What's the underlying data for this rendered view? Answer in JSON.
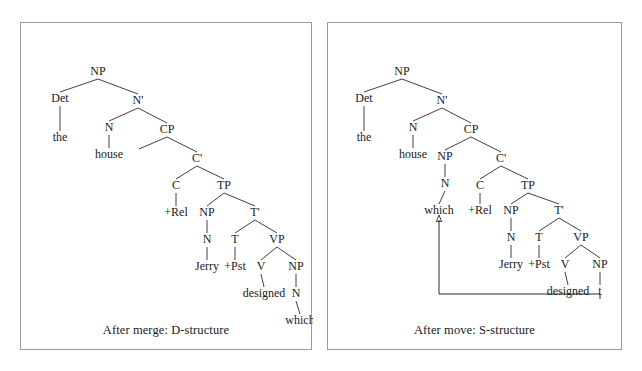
{
  "figure": {
    "background_color": "#ffffff",
    "border_color": "#9a9a9a",
    "text_color": "#1a1a1a",
    "line_color": "#2b2b2b"
  },
  "panels": [
    {
      "id": "left",
      "caption": "After merge: D-structure",
      "nodes": [
        {
          "id": "l-np",
          "label": "NP",
          "x": 77,
          "y": 52
        },
        {
          "id": "l-det",
          "label": "Det",
          "x": 39,
          "y": 79
        },
        {
          "id": "l-nbar",
          "label": "N'",
          "x": 117,
          "y": 81
        },
        {
          "id": "l-the",
          "label": "the",
          "x": 39,
          "y": 118
        },
        {
          "id": "l-n",
          "label": "N",
          "x": 88,
          "y": 108
        },
        {
          "id": "l-cp",
          "label": "CP",
          "x": 146,
          "y": 110
        },
        {
          "id": "l-house",
          "label": "house",
          "x": 88,
          "y": 135
        },
        {
          "id": "l-specempty",
          "label": "",
          "x": 118,
          "y": 136
        },
        {
          "id": "l-cbar",
          "label": "C'",
          "x": 176,
          "y": 139
        },
        {
          "id": "l-c",
          "label": "C",
          "x": 155,
          "y": 166
        },
        {
          "id": "l-tp",
          "label": "TP",
          "x": 203,
          "y": 166
        },
        {
          "id": "l-rel",
          "label": "+Rel",
          "x": 155,
          "y": 193
        },
        {
          "id": "l-np2",
          "label": "NP",
          "x": 186,
          "y": 193
        },
        {
          "id": "l-tbar",
          "label": "T'",
          "x": 234,
          "y": 193
        },
        {
          "id": "l-n2",
          "label": "N",
          "x": 186,
          "y": 220
        },
        {
          "id": "l-t",
          "label": "T",
          "x": 214,
          "y": 220
        },
        {
          "id": "l-vp",
          "label": "VP",
          "x": 256,
          "y": 220
        },
        {
          "id": "l-jerry",
          "label": "Jerry",
          "x": 186,
          "y": 247
        },
        {
          "id": "l-pst",
          "label": "+Pst",
          "x": 214,
          "y": 247
        },
        {
          "id": "l-v",
          "label": "V",
          "x": 240,
          "y": 247
        },
        {
          "id": "l-np3",
          "label": "NP",
          "x": 275,
          "y": 247
        },
        {
          "id": "l-designed",
          "label": "designed",
          "x": 243,
          "y": 274
        },
        {
          "id": "l-n3",
          "label": "N",
          "x": 275,
          "y": 274
        },
        {
          "id": "l-which",
          "label": "which",
          "x": 279,
          "y": 301
        }
      ],
      "edges": [
        [
          "l-np",
          "l-det"
        ],
        [
          "l-np",
          "l-nbar"
        ],
        [
          "l-det",
          "l-the"
        ],
        [
          "l-nbar",
          "l-n"
        ],
        [
          "l-nbar",
          "l-cp"
        ],
        [
          "l-n",
          "l-house"
        ],
        [
          "l-cp",
          "l-specempty"
        ],
        [
          "l-cp",
          "l-cbar"
        ],
        [
          "l-cbar",
          "l-c"
        ],
        [
          "l-cbar",
          "l-tp"
        ],
        [
          "l-c",
          "l-rel"
        ],
        [
          "l-tp",
          "l-np2"
        ],
        [
          "l-tp",
          "l-tbar"
        ],
        [
          "l-np2",
          "l-n2"
        ],
        [
          "l-tbar",
          "l-t"
        ],
        [
          "l-tbar",
          "l-vp"
        ],
        [
          "l-n2",
          "l-jerry"
        ],
        [
          "l-t",
          "l-pst"
        ],
        [
          "l-vp",
          "l-v"
        ],
        [
          "l-vp",
          "l-np3"
        ],
        [
          "l-v",
          "l-designed"
        ],
        [
          "l-np3",
          "l-n3"
        ],
        [
          "l-n3",
          "l-which"
        ]
      ],
      "movement": null
    },
    {
      "id": "right",
      "caption": "After move: S-structure",
      "nodes": [
        {
          "id": "r-np",
          "label": "NP",
          "x": 74,
          "y": 52
        },
        {
          "id": "r-det",
          "label": "Det",
          "x": 36,
          "y": 79
        },
        {
          "id": "r-nbar",
          "label": "N'",
          "x": 114,
          "y": 81
        },
        {
          "id": "r-the",
          "label": "the",
          "x": 36,
          "y": 118
        },
        {
          "id": "r-n",
          "label": "N",
          "x": 85,
          "y": 108
        },
        {
          "id": "r-cp",
          "label": "CP",
          "x": 143,
          "y": 110
        },
        {
          "id": "r-house",
          "label": "house",
          "x": 85,
          "y": 135
        },
        {
          "id": "r-npspec",
          "label": "NP",
          "x": 117,
          "y": 137
        },
        {
          "id": "r-cbar",
          "label": "C'",
          "x": 173,
          "y": 139
        },
        {
          "id": "r-nspec",
          "label": "N",
          "x": 117,
          "y": 164
        },
        {
          "id": "r-c",
          "label": "C",
          "x": 152,
          "y": 166
        },
        {
          "id": "r-tp",
          "label": "TP",
          "x": 200,
          "y": 166
        },
        {
          "id": "r-which",
          "label": "which",
          "x": 111,
          "y": 191
        },
        {
          "id": "r-rel",
          "label": "+Rel",
          "x": 152,
          "y": 191
        },
        {
          "id": "r-np2",
          "label": "NP",
          "x": 183,
          "y": 191
        },
        {
          "id": "r-tbar",
          "label": "T'",
          "x": 231,
          "y": 191
        },
        {
          "id": "r-n2",
          "label": "N",
          "x": 183,
          "y": 218
        },
        {
          "id": "r-t",
          "label": "T",
          "x": 211,
          "y": 218
        },
        {
          "id": "r-vp",
          "label": "VP",
          "x": 253,
          "y": 218
        },
        {
          "id": "r-jerry",
          "label": "Jerry",
          "x": 183,
          "y": 245
        },
        {
          "id": "r-pst",
          "label": "+Pst",
          "x": 211,
          "y": 245
        },
        {
          "id": "r-v",
          "label": "V",
          "x": 237,
          "y": 245
        },
        {
          "id": "r-np3",
          "label": "NP",
          "x": 272,
          "y": 245
        },
        {
          "id": "r-designed",
          "label": "designed",
          "x": 240,
          "y": 272
        },
        {
          "id": "r-trace",
          "label": "t",
          "x": 272,
          "y": 272
        }
      ],
      "edges": [
        [
          "r-np",
          "r-det"
        ],
        [
          "r-np",
          "r-nbar"
        ],
        [
          "r-det",
          "r-the"
        ],
        [
          "r-nbar",
          "r-n"
        ],
        [
          "r-nbar",
          "r-cp"
        ],
        [
          "r-n",
          "r-house"
        ],
        [
          "r-cp",
          "r-npspec"
        ],
        [
          "r-cp",
          "r-cbar"
        ],
        [
          "r-npspec",
          "r-nspec"
        ],
        [
          "r-nspec",
          "r-which"
        ],
        [
          "r-cbar",
          "r-c"
        ],
        [
          "r-cbar",
          "r-tp"
        ],
        [
          "r-c",
          "r-rel"
        ],
        [
          "r-tp",
          "r-np2"
        ],
        [
          "r-tp",
          "r-tbar"
        ],
        [
          "r-np2",
          "r-n2"
        ],
        [
          "r-tbar",
          "r-t"
        ],
        [
          "r-tbar",
          "r-vp"
        ],
        [
          "r-n2",
          "r-jerry"
        ],
        [
          "r-t",
          "r-pst"
        ],
        [
          "r-vp",
          "r-v"
        ],
        [
          "r-vp",
          "r-np3"
        ],
        [
          "r-v",
          "r-designed"
        ],
        [
          "r-np3",
          "r-trace"
        ]
      ],
      "movement": {
        "label": "move-arrow-which",
        "from_node": "r-trace",
        "to_node": "r-which",
        "start_x": 272,
        "start_y": 276,
        "bottom_y": 271,
        "left_x": 111,
        "end_y": 197
      }
    }
  ]
}
